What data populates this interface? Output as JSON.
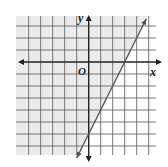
{
  "chart_data": {
    "type": "line",
    "title": "",
    "xlabel": "x",
    "ylabel": "y",
    "origin_label": "O",
    "xlim": [
      -6,
      5.6
    ],
    "ylim": [
      -7.75,
      3.8
    ],
    "grid": true,
    "grid_step": 1,
    "boundary": {
      "equation": "y = 2x - 6",
      "slope": 2,
      "y_intercept": -6,
      "x_intercept": 3,
      "style": "solid",
      "arrows": "both",
      "points": [
        [
          -1,
          -8
        ],
        [
          4.8,
          3.6
        ]
      ]
    },
    "shading": {
      "side": "above-left",
      "inequality": "y >= 2x - 6",
      "color": "#ebebeb"
    },
    "colors": {
      "grid": "#555555",
      "axes": "#222222",
      "line": "#555555",
      "shade": "#ebebeb"
    }
  },
  "labels": {
    "x_axis": "x",
    "y_axis": "y",
    "origin": "O"
  }
}
